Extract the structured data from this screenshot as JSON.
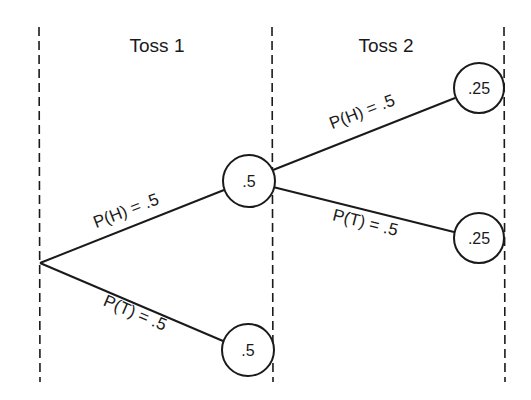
{
  "diagram": {
    "type": "probability-tree",
    "columns": [
      {
        "label": "Toss 1"
      },
      {
        "label": "Toss 2"
      }
    ],
    "edges": [
      {
        "label": "P(H) = .5",
        "from": "root",
        "to": "toss1-heads"
      },
      {
        "label": "P(T) = .5",
        "from": "root",
        "to": "toss1-tails"
      },
      {
        "label": "P(H) = .5",
        "from": "toss1-heads",
        "to": "toss2-heads"
      },
      {
        "label": "P(T) = .5",
        "from": "toss1-heads",
        "to": "toss2-tails"
      }
    ],
    "nodes": [
      {
        "id": "toss1-heads",
        "value": ".5"
      },
      {
        "id": "toss1-tails",
        "value": ".5"
      },
      {
        "id": "toss2-heads",
        "value": ".25"
      },
      {
        "id": "toss2-tails",
        "value": ".25"
      }
    ]
  }
}
